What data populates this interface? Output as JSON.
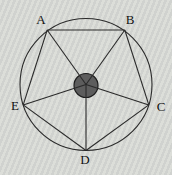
{
  "diagram": {
    "type": "geometry-figure",
    "canvas": {
      "width": 172,
      "height": 175
    },
    "colors": {
      "background": "#d6d8d5",
      "background_stripe_light": "#dcded9",
      "background_stripe_dark": "#d0d2cf",
      "line": "#2a2a2a",
      "hub_fill": "#5d5d5d",
      "hub_stroke": "#1d1d1d",
      "label": "#111111"
    },
    "circle": {
      "cx": 86,
      "cy": 84.5,
      "r": 66
    },
    "hub": {
      "cx": 86,
      "cy": 85.5,
      "r": 12
    },
    "line_width": 1.1,
    "label_font_size": 13,
    "vertices": [
      {
        "label": "A",
        "x": 47.2,
        "y": 30,
        "label_x": 41,
        "label_y": 24
      },
      {
        "label": "B",
        "x": 124.8,
        "y": 30,
        "label_x": 130,
        "label_y": 24
      },
      {
        "label": "C",
        "x": 148.8,
        "y": 104.9,
        "label_x": 161,
        "label_y": 111
      },
      {
        "label": "D",
        "x": 86,
        "y": 150.5,
        "label_x": 85,
        "label_y": 164
      },
      {
        "label": "E",
        "x": 23.2,
        "y": 104.9,
        "label_x": 15,
        "label_y": 110
      }
    ],
    "edges": [
      [
        "A",
        "B"
      ],
      [
        "B",
        "C"
      ],
      [
        "C",
        "D"
      ],
      [
        "D",
        "E"
      ],
      [
        "E",
        "A"
      ]
    ],
    "spokes": [
      "A",
      "B",
      "C",
      "D",
      "E"
    ]
  }
}
